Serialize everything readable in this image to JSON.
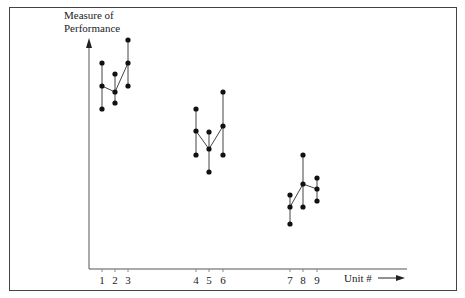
{
  "chart_data": {
    "type": "scatter",
    "title": "",
    "ylabel": "Measure of Performance",
    "xlabel": "Unit #",
    "grid": false,
    "groups": [
      {
        "units": [
          1,
          2,
          3
        ]
      },
      {
        "units": [
          4,
          5,
          6
        ]
      },
      {
        "units": [
          7,
          8,
          9
        ]
      }
    ],
    "units": [
      {
        "unit": "1",
        "x": 102,
        "high": 63,
        "mid": 86,
        "low": 109
      },
      {
        "unit": "2",
        "x": 115,
        "high": 74,
        "mid": 92,
        "low": 103
      },
      {
        "unit": "3",
        "x": 128,
        "high": 40,
        "mid": 63,
        "low": 86
      },
      {
        "unit": "4",
        "x": 196,
        "high": 109,
        "mid": 131,
        "low": 155
      },
      {
        "unit": "5",
        "x": 209,
        "high": 132,
        "mid": 149,
        "low": 172
      },
      {
        "unit": "6",
        "x": 223,
        "high": 92,
        "mid": 126,
        "low": 155
      },
      {
        "unit": "7",
        "x": 290,
        "high": 195,
        "mid": 207,
        "low": 224
      },
      {
        "unit": "8",
        "x": 303,
        "high": 155,
        "mid": 184,
        "low": 207
      },
      {
        "unit": "9",
        "x": 317,
        "high": 178,
        "mid": 189,
        "low": 201
      }
    ],
    "note": "values are pixel y-positions (smaller = higher performance); axis has no numeric scale"
  },
  "labels": {
    "ylabel_line1": "Measure of",
    "ylabel_line2": "Performance",
    "xlabel": "Unit #"
  },
  "colors": {
    "ink": "#222222",
    "frame": "#444444"
  }
}
